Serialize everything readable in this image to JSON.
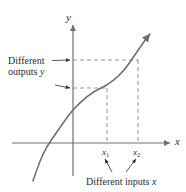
{
  "figure": {
    "axes": {
      "x_label": "x",
      "y_label": "y",
      "x_axis_y_px": 143,
      "y_axis_x_px": 73
    },
    "tick_labels": {
      "x1": "x",
      "x1_sub": "1",
      "x2": "x",
      "x2_sub": "2"
    },
    "annotations": {
      "outputs_line1": "Different",
      "outputs_line2_text": "outputs ",
      "outputs_line2_var": "y",
      "inputs_text": "Different inputs ",
      "inputs_var": "x"
    },
    "colors": {
      "curve": "#6b6b6b",
      "axis": "#707070",
      "dashed": "#8a8a8a",
      "text": "#2b2b2b",
      "background": "#ffffff"
    },
    "curve": {
      "type": "increasing-cubic",
      "path": "M 33,181 C 40,160 44,150 52,139 C 62,125 66,118 73,110 C 84,98 92,92 101,88 C 110,84 117,78 124,70 C 133,59 140,46 150,34",
      "x_axis_crossing_px": 47
    },
    "guides": {
      "x1_px": 107,
      "x2_px": 138,
      "y1_px": 88,
      "y2_px": 60
    }
  }
}
